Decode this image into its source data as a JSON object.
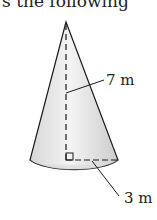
{
  "header": {
    "text": "s the following"
  },
  "figure": {
    "shape": "cone",
    "height_label": "7 m",
    "radius_label": "3 m",
    "colors": {
      "stroke": "#1a1a1a",
      "fill_light": "#f2f2f2",
      "fill_dark": "#cfcfcf"
    }
  }
}
